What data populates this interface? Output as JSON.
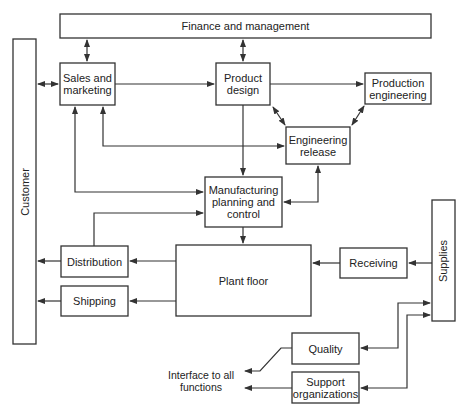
{
  "nodes": {
    "finance": "Finance and management",
    "customer": "Customer",
    "sales": "Sales and marketing",
    "product_design": "Product design",
    "production_engineering": "Production engineering",
    "engineering_release": "Engineering release",
    "mfg_planning": "Manufacturing planning and control",
    "plant_floor": "Plant floor",
    "distribution": "Distribution",
    "shipping": "Shipping",
    "receiving": "Receiving",
    "supplies": "Supplies",
    "quality": "Quality",
    "support": "Support organizations",
    "interface": "Interface to all functions"
  },
  "colors": {
    "stroke": "#333333",
    "background": "#ffffff"
  }
}
